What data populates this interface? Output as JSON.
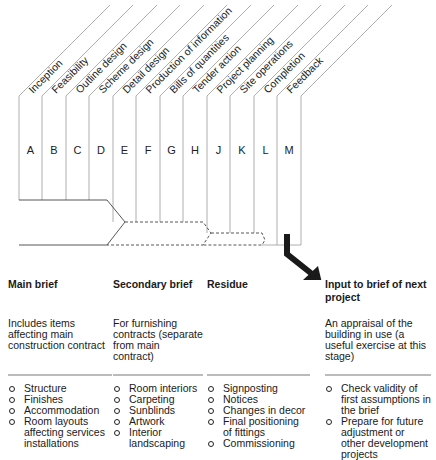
{
  "diagram": {
    "stages": [
      {
        "letter": "A",
        "label": "Inception"
      },
      {
        "letter": "B",
        "label": "Feasibility"
      },
      {
        "letter": "C",
        "label": "Outline design"
      },
      {
        "letter": "D",
        "label": "Scheme design"
      },
      {
        "letter": "E",
        "label": "Detail design"
      },
      {
        "letter": "F",
        "label": "Production of information"
      },
      {
        "letter": "G",
        "label": "Bills of quantities"
      },
      {
        "letter": "H",
        "label": "Tender action"
      },
      {
        "letter": "J",
        "label": "Project planning"
      },
      {
        "letter": "K",
        "label": "Site operations"
      },
      {
        "letter": "L",
        "label": "Completion"
      },
      {
        "letter": "M",
        "label": "Feedback"
      }
    ],
    "line_color": "#9a9a9a",
    "arrow_color": "#1a1a1a"
  },
  "columns": [
    {
      "title": "Main brief",
      "description": "Includes items affecting main construction contract",
      "items": [
        "Structure",
        "Finishes",
        "Accommodation",
        "Room layouts affecting services installations"
      ]
    },
    {
      "title": "Secondary brief",
      "description": "For furnishing contracts (separate from main contract)",
      "items": [
        "Room interiors",
        "Carpeting",
        "Sunblinds",
        "Artwork",
        "Interior landscaping"
      ]
    },
    {
      "title": "Residue",
      "description": "",
      "items": [
        "Signposting",
        "Notices",
        "Changes in decor",
        "Final positioning of fittings",
        "Commissioning"
      ]
    },
    {
      "title": "Input to brief of next project",
      "description": "An appraisal of the building in use (a useful exercise at this stage)",
      "items": [
        "Check validity of first assumptions in the brief",
        "Prepare for future adjustment or other development projects"
      ]
    }
  ]
}
